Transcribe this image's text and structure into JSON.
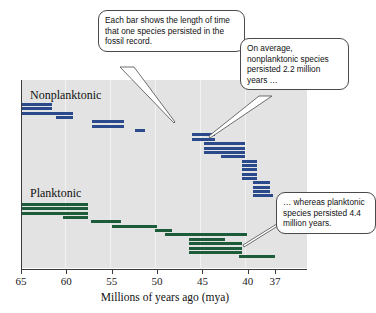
{
  "figure": {
    "group_labels": {
      "nonplanktonic": "Nonplanktonic",
      "planktonic": "Planktonic"
    },
    "callouts": {
      "bar_meaning": "Each bar shows the length of time that one species persisted in the fossil record.",
      "nonplanktonic_avg": "On average, nonplanktonic species persisted 2.2 million years …",
      "planktonic_avg": "… whereas planktonic species persisted 4.4 million years."
    },
    "colors": {
      "nonplanktonic_bar": "#2b4a8b",
      "planktonic_bar": "#1d5c3a",
      "plot_background": "#e3e3e3",
      "axis": "#3a3a3a",
      "callout_border": "#4a4a4a"
    }
  },
  "chart_data": {
    "type": "bar",
    "orientation": "horizontal",
    "title": "",
    "subtitle": "",
    "xlabel": "Millions of years ago (mya)",
    "ylabel": "",
    "xlim": [
      65,
      37
    ],
    "x_axis_reversed": true,
    "ticks": [
      65,
      60,
      55,
      50,
      45,
      40,
      37
    ],
    "tick_labels": [
      "65",
      "60",
      "55",
      "50",
      "45",
      "40",
      "37"
    ],
    "grid": true,
    "legend": "none",
    "units": "million years ago (mya)",
    "annotations": [
      "Each bar shows the length of time that one species persisted in the fossil record.",
      "On average, nonplanktonic species persisted 2.2 million years …",
      "… whereas planktonic species persisted 4.4 million years."
    ],
    "summary_statistics": {
      "nonplanktonic_mean_duration_myr": 2.2,
      "planktonic_mean_duration_myr": 4.4
    },
    "series": [
      {
        "name": "Nonplanktonic",
        "color": "#2b4a8b",
        "bars": [
          {
            "start_mya": 64.9,
            "end_mya": 61.6
          },
          {
            "start_mya": 64.9,
            "end_mya": 61.6
          },
          {
            "start_mya": 64.9,
            "end_mya": 59.3
          },
          {
            "start_mya": 61.1,
            "end_mya": 59.3
          },
          {
            "start_mya": 57.2,
            "end_mya": 53.7
          },
          {
            "start_mya": 57.2,
            "end_mya": 53.7
          },
          {
            "start_mya": 52.4,
            "end_mya": 51.3
          },
          {
            "start_mya": 46.2,
            "end_mya": 43.6
          },
          {
            "start_mya": 46.2,
            "end_mya": 43.6
          },
          {
            "start_mya": 44.8,
            "end_mya": 40.3
          },
          {
            "start_mya": 44.8,
            "end_mya": 40.3
          },
          {
            "start_mya": 44.8,
            "end_mya": 40.3
          },
          {
            "start_mya": 43.0,
            "end_mya": 40.3
          },
          {
            "start_mya": 40.6,
            "end_mya": 39.0
          },
          {
            "start_mya": 40.6,
            "end_mya": 39.0
          },
          {
            "start_mya": 40.6,
            "end_mya": 39.0
          },
          {
            "start_mya": 40.6,
            "end_mya": 39.0
          },
          {
            "start_mya": 40.6,
            "end_mya": 39.0
          },
          {
            "start_mya": 39.4,
            "end_mya": 37.5
          },
          {
            "start_mya": 39.4,
            "end_mya": 37.5
          },
          {
            "start_mya": 39.4,
            "end_mya": 37.5
          },
          {
            "start_mya": 39.4,
            "end_mya": 37.2
          }
        ]
      },
      {
        "name": "Planktonic",
        "color": "#1d5c3a",
        "bars": [
          {
            "start_mya": 64.9,
            "end_mya": 57.6
          },
          {
            "start_mya": 64.9,
            "end_mya": 57.6
          },
          {
            "start_mya": 64.9,
            "end_mya": 57.6
          },
          {
            "start_mya": 60.4,
            "end_mya": 57.6
          },
          {
            "start_mya": 57.3,
            "end_mya": 54.0
          },
          {
            "start_mya": 55.0,
            "end_mya": 50.0
          },
          {
            "start_mya": 50.2,
            "end_mya": 48.3
          },
          {
            "start_mya": 49.1,
            "end_mya": 40.1
          },
          {
            "start_mya": 46.5,
            "end_mya": 42.5
          },
          {
            "start_mya": 46.5,
            "end_mya": 40.6
          },
          {
            "start_mya": 46.5,
            "end_mya": 40.6
          },
          {
            "start_mya": 46.5,
            "end_mya": 40.6
          },
          {
            "start_mya": 41.0,
            "end_mya": 37.0
          }
        ]
      }
    ]
  }
}
